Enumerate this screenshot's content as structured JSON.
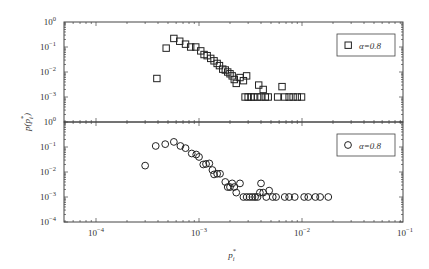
{
  "chart_data": [
    {
      "type": "scatter",
      "panel": "top",
      "title": "",
      "xlabel": "p_i^*",
      "ylabel": "p(p_i^*)",
      "xscale": "log",
      "yscale": "log",
      "xlim": [
        5e-05,
        0.1
      ],
      "ylim": [
        0.0001,
        1
      ],
      "xticks": [
        "10^-4",
        "10^-3",
        "10^-2",
        "10^-1"
      ],
      "yticks": [
        "10^0",
        "10^-1",
        "10^-2",
        "10^-3"
      ],
      "legend": {
        "marker": "square",
        "label": "α=0.8",
        "position": "upper right"
      },
      "series": [
        {
          "name": "α=0.8",
          "marker": "square",
          "points": [
            [
              0.00039,
              0.0055
            ],
            [
              0.00048,
              0.09
            ],
            [
              0.00057,
              0.22
            ],
            [
              0.00065,
              0.17
            ],
            [
              0.00074,
              0.13
            ],
            [
              0.00083,
              0.1
            ],
            [
              0.00093,
              0.1
            ],
            [
              0.00104,
              0.07
            ],
            [
              0.00112,
              0.05
            ],
            [
              0.0012,
              0.045
            ],
            [
              0.0013,
              0.035
            ],
            [
              0.0014,
              0.028
            ],
            [
              0.0015,
              0.022
            ],
            [
              0.00158,
              0.018
            ],
            [
              0.0017,
              0.013
            ],
            [
              0.0018,
              0.012
            ],
            [
              0.0019,
              0.01
            ],
            [
              0.002,
              0.0085
            ],
            [
              0.0021,
              0.007
            ],
            [
              0.0022,
              0.005
            ],
            [
              0.0023,
              0.0035
            ],
            [
              0.0025,
              0.006
            ],
            [
              0.0027,
              0.0045
            ],
            [
              0.0029,
              0.007
            ],
            [
              0.0028,
              0.001
            ],
            [
              0.003,
              0.001
            ],
            [
              0.0032,
              0.001
            ],
            [
              0.0034,
              0.001
            ],
            [
              0.0037,
              0.001
            ],
            [
              0.0038,
              0.003
            ],
            [
              0.004,
              0.001
            ],
            [
              0.0042,
              0.002
            ],
            [
              0.0044,
              0.001
            ],
            [
              0.0047,
              0.001
            ],
            [
              0.0058,
              0.001
            ],
            [
              0.0064,
              0.0026
            ],
            [
              0.0068,
              0.001
            ],
            [
              0.0075,
              0.001
            ],
            [
              0.0082,
              0.001
            ],
            [
              0.009,
              0.001
            ],
            [
              0.0099,
              0.001
            ]
          ]
        }
      ]
    },
    {
      "type": "scatter",
      "panel": "bottom",
      "title": "",
      "xlabel": "p_i^*",
      "ylabel": "p(p_i^*)",
      "xscale": "log",
      "yscale": "log",
      "xlim": [
        5e-05,
        0.1
      ],
      "ylim": [
        0.0001,
        1
      ],
      "xticks": [
        "10^-4",
        "10^-3",
        "10^-2",
        "10^-1"
      ],
      "yticks": [
        "10^0",
        "10^-1",
        "10^-2",
        "10^-3",
        "10^-4"
      ],
      "legend": {
        "marker": "circle",
        "label": "α=0.8",
        "position": "upper right"
      },
      "series": [
        {
          "name": "α=0.8",
          "marker": "circle",
          "points": [
            [
              0.0003,
              0.018
            ],
            [
              0.00038,
              0.11
            ],
            [
              0.00047,
              0.13
            ],
            [
              0.00057,
              0.16
            ],
            [
              0.00066,
              0.11
            ],
            [
              0.00074,
              0.09
            ],
            [
              0.00085,
              0.055
            ],
            [
              0.00094,
              0.05
            ],
            [
              0.001,
              0.04
            ],
            [
              0.0011,
              0.02
            ],
            [
              0.00117,
              0.021
            ],
            [
              0.00126,
              0.022
            ],
            [
              0.00135,
              0.012
            ],
            [
              0.0014,
              0.008
            ],
            [
              0.0015,
              0.0085
            ],
            [
              0.0016,
              0.0085
            ],
            [
              0.0018,
              0.004
            ],
            [
              0.0019,
              0.0025
            ],
            [
              0.002,
              0.0025
            ],
            [
              0.0021,
              0.0035
            ],
            [
              0.0022,
              0.0025
            ],
            [
              0.0023,
              0.0015
            ],
            [
              0.0025,
              0.0035
            ],
            [
              0.0027,
              0.001
            ],
            [
              0.0029,
              0.001
            ],
            [
              0.0031,
              0.001
            ],
            [
              0.0033,
              0.001
            ],
            [
              0.0035,
              0.001
            ],
            [
              0.0037,
              0.001
            ],
            [
              0.0039,
              0.0015
            ],
            [
              0.004,
              0.0035
            ],
            [
              0.0042,
              0.0015
            ],
            [
              0.0045,
              0.001
            ],
            [
              0.0048,
              0.0018
            ],
            [
              0.0052,
              0.001
            ],
            [
              0.0056,
              0.001
            ],
            [
              0.0068,
              0.001
            ],
            [
              0.0075,
              0.001
            ],
            [
              0.0085,
              0.001
            ],
            [
              0.0105,
              0.001
            ],
            [
              0.0115,
              0.001
            ],
            [
              0.0135,
              0.001
            ],
            [
              0.015,
              0.001
            ],
            [
              0.018,
              0.001
            ]
          ]
        }
      ]
    }
  ],
  "labels": {
    "ylabel": "p(p",
    "ylabel_sub": "i",
    "ylabel_sup": "*",
    "ylabel_end": ")",
    "xlabel": "p",
    "xlabel_sub": "i",
    "xlabel_sup": "*",
    "legend_top": "α=0.8",
    "legend_bottom": "α=0.8"
  }
}
